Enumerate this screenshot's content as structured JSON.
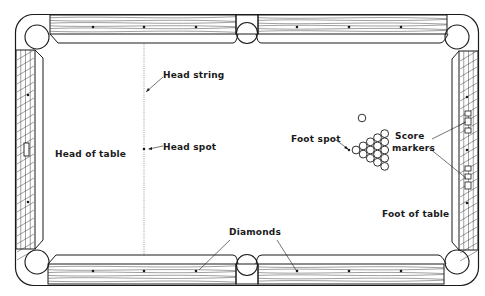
{
  "diagram": {
    "labels": {
      "head_string": "Head string",
      "head_spot": "Head spot",
      "head_of_table": "Head of table",
      "foot_spot": "Foot spot",
      "score_markers_line1": "Score",
      "score_markers_line2": "markers",
      "foot_of_table": "Foot of table",
      "diamonds": "Diamonds"
    },
    "pockets": {
      "corner": 4,
      "side": 2
    },
    "diamonds_per_long_rail_segment": 3,
    "diamonds_per_short_rail": 3,
    "racked_balls": 15,
    "cue_ball": 1,
    "colors": {
      "ink": "#1a1a1a",
      "background": "#ffffff"
    }
  }
}
